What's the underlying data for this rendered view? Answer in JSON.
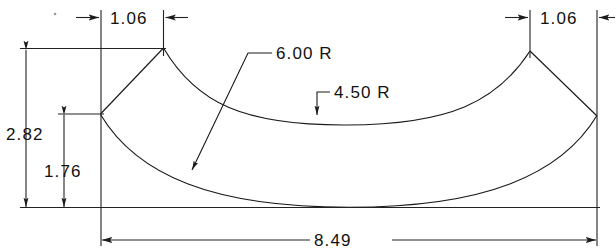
{
  "drawing": {
    "title": "Curved arc segment part drawing",
    "units_note": "",
    "line_color": "#1a1a1a",
    "background_color": "#ffffff",
    "dimensions": [
      {
        "id": "top-left-width",
        "label": "1.06",
        "orientation": "horizontal",
        "position": "top-left"
      },
      {
        "id": "top-right-width",
        "label": "1.06",
        "orientation": "horizontal",
        "position": "top-right"
      },
      {
        "id": "overall-height",
        "label": "2.82",
        "orientation": "vertical",
        "position": "left-outer"
      },
      {
        "id": "inner-height",
        "label": "1.76",
        "orientation": "vertical",
        "position": "left-inner"
      },
      {
        "id": "overall-width",
        "label": "8.49",
        "orientation": "horizontal",
        "position": "bottom"
      }
    ],
    "radii": [
      {
        "id": "outer-radius",
        "label": "6.00  R",
        "value": "6.00",
        "symbol": "R",
        "applies_to": "bottom-outer-arc"
      },
      {
        "id": "inner-radius",
        "label": "4.50  R",
        "value": "4.50",
        "symbol": "R",
        "applies_to": "top-inner-arc"
      }
    ]
  }
}
